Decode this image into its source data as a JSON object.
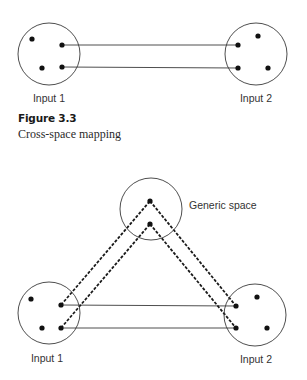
{
  "top_diagram": {
    "spaces": [
      {
        "id": "input1",
        "label": "Input 1",
        "circle": {
          "cx": 49,
          "cy": 54,
          "r": 31
        },
        "label_pos": {
          "x": 49,
          "y": 102
        },
        "dots": [
          [
            32,
            39
          ],
          [
            62,
            45
          ],
          [
            42,
            68
          ],
          [
            62,
            67
          ]
        ]
      },
      {
        "id": "input2",
        "label": "Input 2",
        "circle": {
          "cx": 256,
          "cy": 54,
          "r": 31
        },
        "label_pos": {
          "x": 256,
          "y": 102
        },
        "dots": [
          [
            238,
            45
          ],
          [
            258,
            36
          ],
          [
            238,
            68
          ],
          [
            268,
            68
          ]
        ]
      }
    ],
    "solid_links": [
      [
        [
          62,
          45
        ],
        [
          238,
          45
        ]
      ],
      [
        [
          62,
          67
        ],
        [
          238,
          68
        ]
      ]
    ]
  },
  "figure": {
    "number": "Figure 3.3",
    "caption": "Cross-space mapping"
  },
  "bottom_diagram": {
    "spaces": [
      {
        "id": "generic",
        "label": "Generic space",
        "circle": {
          "cx": 151,
          "cy": 209,
          "r": 31
        },
        "label_pos": {
          "x": 189,
          "y": 209
        },
        "dots": [
          [
            150,
            201
          ],
          [
            150,
            224
          ]
        ]
      },
      {
        "id": "input1",
        "label": "Input 1",
        "circle": {
          "cx": 49,
          "cy": 313,
          "r": 31
        },
        "label_pos": {
          "x": 47,
          "y": 362
        },
        "dots": [
          [
            31,
            299
          ],
          [
            61,
            305
          ],
          [
            42,
            328
          ],
          [
            61,
            328
          ]
        ]
      },
      {
        "id": "input2",
        "label": "Input 2",
        "circle": {
          "cx": 255,
          "cy": 315,
          "r": 31
        },
        "label_pos": {
          "x": 256,
          "y": 363
        },
        "dots": [
          [
            236,
            306
          ],
          [
            257,
            297
          ],
          [
            236,
            328
          ],
          [
            267,
            328
          ]
        ]
      }
    ],
    "solid_links": [
      [
        [
          61,
          305
        ],
        [
          236,
          306
        ]
      ],
      [
        [
          61,
          328
        ],
        [
          236,
          328
        ]
      ]
    ],
    "dashed_links": [
      [
        [
          61,
          305
        ],
        [
          150,
          201
        ]
      ],
      [
        [
          61,
          328
        ],
        [
          150,
          224
        ]
      ],
      [
        [
          150,
          201
        ],
        [
          236,
          306
        ]
      ],
      [
        [
          150,
          224
        ],
        [
          236,
          328
        ]
      ]
    ]
  }
}
